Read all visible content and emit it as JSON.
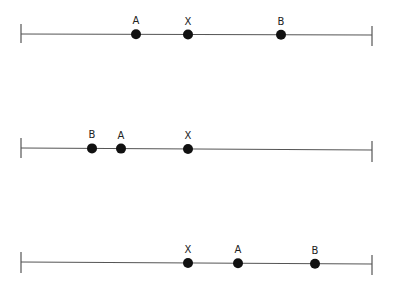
{
  "colors": {
    "line": "#555555",
    "dot": "#111111",
    "label": "#222222",
    "background": "#ffffff"
  },
  "lines": [
    {
      "y_left": 34,
      "y_right": 35,
      "tick_left": {
        "x": 21,
        "y1": 24,
        "y2": 43
      },
      "tick_right": {
        "x": 372,
        "y1": 26,
        "y2": 46
      },
      "points": [
        {
          "label": "A",
          "x": 136
        },
        {
          "label": "X",
          "x": 188
        },
        {
          "label": "B",
          "x": 281
        }
      ]
    },
    {
      "y_left": 148,
      "y_right": 150,
      "tick_left": {
        "x": 21,
        "y1": 138,
        "y2": 158
      },
      "tick_right": {
        "x": 372,
        "y1": 141,
        "y2": 162
      },
      "points": [
        {
          "label": "B",
          "x": 92
        },
        {
          "label": "A",
          "x": 121
        },
        {
          "label": "X",
          "x": 188
        }
      ]
    },
    {
      "y_left": 262,
      "y_right": 264,
      "tick_left": {
        "x": 21,
        "y1": 252,
        "y2": 273
      },
      "tick_right": {
        "x": 372,
        "y1": 255,
        "y2": 275
      },
      "points": [
        {
          "label": "X",
          "x": 188
        },
        {
          "label": "A",
          "x": 238
        },
        {
          "label": "B",
          "x": 315
        }
      ]
    }
  ]
}
